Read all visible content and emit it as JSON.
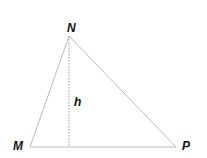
{
  "diagram": {
    "type": "triangle",
    "vertices": {
      "N": {
        "label": "N",
        "x": 69,
        "y": 36
      },
      "M": {
        "label": "M",
        "x": 30,
        "y": 147
      },
      "P": {
        "label": "P",
        "x": 176,
        "y": 147
      }
    },
    "altitude": {
      "label": "h",
      "from": "N",
      "to_x": 69,
      "to_y": 147,
      "style": "dotted"
    },
    "colors": {
      "edge": "#b8b8b8",
      "altitude": "#9a9a9a",
      "label": "#111111"
    }
  }
}
